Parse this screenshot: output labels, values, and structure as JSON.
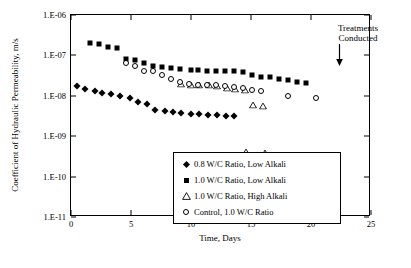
{
  "chart_data": {
    "type": "scatter",
    "title": "",
    "xlabel": "Time, Days",
    "ylabel": "Coefficient of Hydraulic Permeability, m/s",
    "xlim": [
      0,
      25
    ],
    "xticks": [
      "0",
      "5",
      "10",
      "15",
      "20",
      "25"
    ],
    "ylim_log": [
      1e-11,
      1e-06
    ],
    "yticks": [
      "1.E-06",
      "1.E-07",
      "1.E-08",
      "1.E-09",
      "1.E-10",
      "1.E-11"
    ],
    "grid": false,
    "legend_position": "inside-lower-left",
    "annotations": [
      {
        "text_line1": "Treatments",
        "text_line2": "Conducted",
        "arrow": "down"
      }
    ],
    "series": [
      {
        "name": "0.8 W/C Ratio, Low Alkali",
        "marker": "filled-diamond",
        "points": [
          [
            0.5,
            1.7e-08
          ],
          [
            1.2,
            1.5e-08
          ],
          [
            2.0,
            1.35e-08
          ],
          [
            2.6,
            1.2e-08
          ],
          [
            3.3,
            1.1e-08
          ],
          [
            4.1,
            1e-08
          ],
          [
            4.9,
            9e-09
          ],
          [
            5.6,
            7e-09
          ],
          [
            6.3,
            6.3e-09
          ],
          [
            7.0,
            4.5e-09
          ],
          [
            7.8,
            4.2e-09
          ],
          [
            8.5,
            4e-09
          ],
          [
            9.2,
            3.7e-09
          ],
          [
            10.0,
            3.6e-09
          ],
          [
            10.7,
            3.5e-09
          ],
          [
            11.4,
            3.4e-09
          ],
          [
            12.2,
            3.3e-09
          ],
          [
            12.9,
            3.2e-09
          ],
          [
            13.6,
            3.1e-09
          ],
          [
            14.4,
            3e-10
          ],
          [
            15.6,
            2.8e-10
          ],
          [
            14.6,
            1.7e-11
          ],
          [
            15.1,
            1.7e-11
          ],
          [
            20.7,
            1.7e-11
          ]
        ]
      },
      {
        "name": "1.0 W/C Ratio, Low Alkali",
        "marker": "filled-square",
        "points": [
          [
            1.6,
            2e-07
          ],
          [
            2.3,
            1.9e-07
          ],
          [
            3.1,
            1.6e-07
          ],
          [
            3.8,
            1.55e-07
          ],
          [
            4.6,
            8e-08
          ],
          [
            5.3,
            7.5e-08
          ],
          [
            6.1,
            6.5e-08
          ],
          [
            6.8,
            5.5e-08
          ],
          [
            7.6,
            5.2e-08
          ],
          [
            8.3,
            4.8e-08
          ],
          [
            9.1,
            4.6e-08
          ],
          [
            10.0,
            4.4e-08
          ],
          [
            10.6,
            4.3e-08
          ],
          [
            11.3,
            4.2e-08
          ],
          [
            12.1,
            4.2e-08
          ],
          [
            12.8,
            4.1e-08
          ],
          [
            13.6,
            4e-08
          ],
          [
            14.3,
            3.9e-08
          ],
          [
            15.1,
            3.2e-08
          ],
          [
            15.8,
            3e-08
          ],
          [
            16.6,
            2.9e-08
          ],
          [
            17.3,
            2.6e-08
          ],
          [
            18.1,
            2.5e-08
          ],
          [
            18.8,
            2.2e-08
          ],
          [
            19.6,
            2.1e-08
          ]
        ]
      },
      {
        "name": "1.0 W/C Ratio, High Alkali",
        "marker": "open-triangle",
        "points": [
          [
            9.2,
            2e-08
          ],
          [
            10.0,
            1.9e-08
          ],
          [
            10.7,
            1.85e-08
          ],
          [
            11.5,
            1.8e-08
          ],
          [
            12.2,
            1.7e-08
          ],
          [
            13.0,
            1.6e-08
          ],
          [
            13.7,
            1.5e-08
          ],
          [
            14.5,
            1.4e-08
          ],
          [
            15.2,
            6e-09
          ],
          [
            16.0,
            5.5e-09
          ],
          [
            14.6,
            4e-10
          ],
          [
            16.2,
            3.8e-10
          ]
        ]
      },
      {
        "name": "Control, 1.0 W/C Ratio",
        "marker": "open-circle",
        "points": [
          [
            4.6,
            6.5e-08
          ],
          [
            5.3,
            5.5e-08
          ],
          [
            6.1,
            4.2e-08
          ],
          [
            6.8,
            4e-08
          ],
          [
            7.6,
            3.2e-08
          ],
          [
            8.3,
            2.6e-08
          ],
          [
            9.1,
            2.2e-08
          ],
          [
            9.8,
            2e-08
          ],
          [
            10.6,
            1.9e-08
          ],
          [
            11.3,
            1.85e-08
          ],
          [
            12.1,
            1.8e-08
          ],
          [
            12.8,
            1.7e-08
          ],
          [
            13.6,
            1.65e-08
          ],
          [
            14.3,
            1.55e-08
          ],
          [
            15.1,
            1.4e-08
          ],
          [
            15.8,
            1.3e-08
          ],
          [
            18.1,
            1e-08
          ],
          [
            20.4,
            9e-09
          ]
        ]
      }
    ]
  }
}
